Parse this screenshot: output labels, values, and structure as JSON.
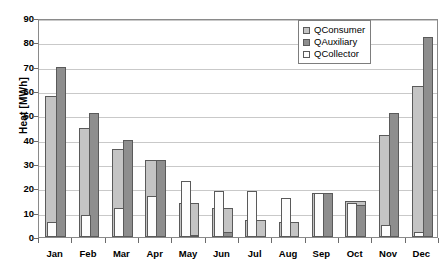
{
  "chart_data": {
    "type": "bar",
    "title": "",
    "xlabel": "",
    "ylabel": "Heat [MWh]",
    "ylim": [
      0,
      90
    ],
    "ytick_step": 10,
    "yticks": [
      0,
      10,
      20,
      30,
      40,
      50,
      60,
      70,
      80,
      90
    ],
    "grid": true,
    "legend_position": "top-right",
    "categories": [
      "Jan",
      "Feb",
      "Mar",
      "Apr",
      "May",
      "Jun",
      "Jul",
      "Aug",
      "Sep",
      "Oct",
      "Nov",
      "Dec"
    ],
    "series": [
      {
        "name": "QConsumer",
        "color": "#c4c4c4",
        "values": [
          58,
          45,
          36,
          31.5,
          14,
          12,
          7,
          6,
          18,
          15,
          42,
          62
        ]
      },
      {
        "name": "QAuxiliary",
        "color": "#8e8e8e",
        "values": [
          70,
          51,
          40,
          31.5,
          1,
          2,
          0,
          0,
          18,
          13,
          51,
          82
        ]
      },
      {
        "name": "QCollector",
        "color": "#fdfdfd",
        "values": [
          6,
          9,
          12,
          17,
          23,
          19,
          19,
          16,
          18,
          14,
          5,
          2
        ]
      }
    ]
  },
  "axis": {
    "y_title": "Heat [MWh]"
  },
  "legend": {
    "items": [
      {
        "label": "QConsumer"
      },
      {
        "label": "QAuxiliary"
      },
      {
        "label": "QCollector"
      }
    ]
  }
}
